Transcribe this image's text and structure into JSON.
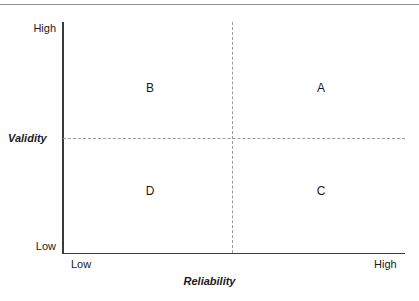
{
  "chart_data": {
    "type": "scatter",
    "title": "",
    "xlabel": "Reliability",
    "ylabel": "Validity",
    "x_tick_labels": [
      "Low",
      "High"
    ],
    "y_tick_labels": [
      "Low",
      "High"
    ],
    "grid": false,
    "legend": "none",
    "annotations": [
      {
        "label": "B",
        "x": "low-mid",
        "y": "high",
        "quadrant": "low-reliability-high-validity"
      },
      {
        "label": "A",
        "x": "high",
        "y": "high",
        "quadrant": "high-reliability-high-validity"
      },
      {
        "label": "D",
        "x": "low-mid",
        "y": "low",
        "quadrant": "low-reliability-low-validity"
      },
      {
        "label": "C",
        "x": "high",
        "y": "low",
        "quadrant": "high-reliability-low-validity"
      }
    ],
    "divider_lines": {
      "vertical": "dashed",
      "horizontal": "dashed",
      "color": "#9a9a9a"
    },
    "colors": {
      "axis": "#3a3a3a",
      "divider": "#9a9a9a",
      "text": "#1a1a1a",
      "rule": "#8c8c8c",
      "background": "#ffffff"
    }
  },
  "figure": {
    "y_axis": {
      "title": "Validity",
      "high_label": "High",
      "low_label": "Low"
    },
    "x_axis": {
      "title": "Reliability",
      "low_label": "Low",
      "high_label": "High"
    },
    "quadrants": {
      "top_left": "B",
      "top_right": "A",
      "bottom_left": "D",
      "bottom_right": "C"
    }
  }
}
